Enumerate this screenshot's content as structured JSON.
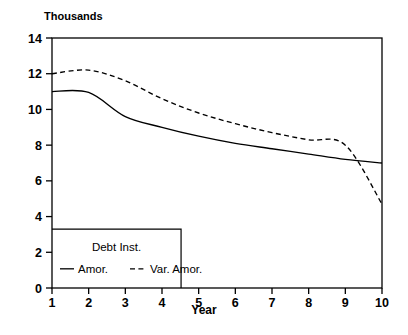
{
  "chart_data": {
    "type": "line",
    "title": "",
    "unit_label": "Thousands",
    "xlabel": "Year",
    "ylabel": "",
    "xlim": [
      1,
      10
    ],
    "ylim": [
      0,
      14
    ],
    "xticks": [
      "1",
      "2",
      "3",
      "4",
      "5",
      "6",
      "7",
      "8",
      "9",
      "10"
    ],
    "yticks": [
      "0",
      "2",
      "4",
      "6",
      "8",
      "10",
      "12",
      "14"
    ],
    "grid": false,
    "legend_position": "bottom-left-inside",
    "legend_title": "Debt Inst.",
    "x": [
      1,
      2,
      3,
      4,
      5,
      6,
      7,
      8,
      9,
      10
    ],
    "series": [
      {
        "name": "Amor.",
        "style": "solid",
        "color": "#000000",
        "values": [
          11.0,
          10.95,
          9.6,
          9.0,
          8.5,
          8.1,
          7.8,
          7.5,
          7.2,
          7.0
        ]
      },
      {
        "name": "Var. Amor.",
        "style": "dashed",
        "color": "#000000",
        "values": [
          12.0,
          12.2,
          11.6,
          10.6,
          9.8,
          9.2,
          8.7,
          8.3,
          8.0,
          4.7
        ]
      }
    ]
  },
  "axis": {
    "frame_color": "#000000"
  }
}
